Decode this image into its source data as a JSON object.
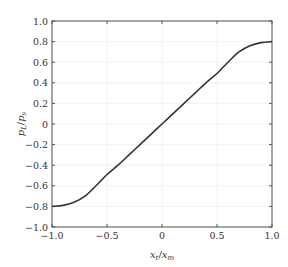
{
  "chart_data": {
    "type": "line",
    "title": "",
    "xlabel": "x_t / x_m",
    "ylabel": "p_L / p_s",
    "xlabel_parts": {
      "main": "x",
      "sub": "t",
      "sep": "/",
      "main2": "x",
      "sub2": "m"
    },
    "ylabel_parts": {
      "main": "p",
      "sub": "L",
      "sep": "/",
      "main2": "p",
      "sub2": "s"
    },
    "xlim": [
      -1.0,
      1.0
    ],
    "ylim": [
      -1.0,
      1.0
    ],
    "xticks": [
      -1.0,
      -0.5,
      0,
      0.5,
      1.0
    ],
    "xtick_labels": [
      "−1.0",
      "−0.5",
      "0",
      "0.5",
      "1.0"
    ],
    "yticks": [
      -1.0,
      -0.8,
      -0.6,
      -0.4,
      -0.2,
      0,
      0.2,
      0.4,
      0.6,
      0.8,
      1.0
    ],
    "ytick_labels": [
      "−1.0",
      "−0.8",
      "−0.6",
      "−0.4",
      "−0.2",
      "0",
      "0.2",
      "0.4",
      "0.6",
      "0.8",
      "1.0"
    ],
    "grid": true,
    "legend": null,
    "line_color": "#333333",
    "series": [
      {
        "name": "p_L/p_s",
        "x": [
          -1.0,
          -0.9,
          -0.8,
          -0.7,
          -0.6,
          -0.5,
          -0.4,
          -0.3,
          -0.2,
          -0.1,
          0.0,
          0.1,
          0.2,
          0.3,
          0.4,
          0.5,
          0.6,
          0.7,
          0.8,
          0.9,
          1.0
        ],
        "y": [
          -0.8,
          -0.79,
          -0.76,
          -0.7,
          -0.6,
          -0.49,
          -0.4,
          -0.3,
          -0.2,
          -0.1,
          0.0,
          0.1,
          0.2,
          0.3,
          0.4,
          0.49,
          0.6,
          0.7,
          0.76,
          0.79,
          0.8
        ]
      }
    ]
  }
}
